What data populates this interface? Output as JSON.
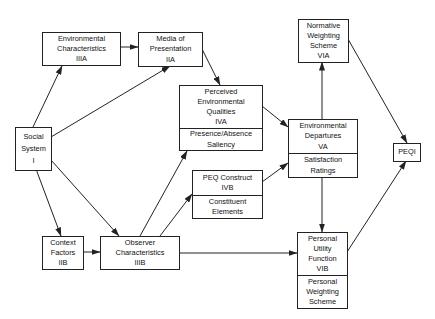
{
  "diagram": {
    "type": "flowchart",
    "line_color": "#222222",
    "nodes": {
      "env_char": {
        "lines": [
          "Environmental",
          "Characteristics",
          "IIIA"
        ]
      },
      "media": {
        "lines": [
          "Media of",
          "Presentation",
          "IIA"
        ]
      },
      "social": {
        "lines": [
          "Social",
          "System",
          "I"
        ]
      },
      "context": {
        "lines": [
          "Context",
          "Factors",
          "IIB"
        ]
      },
      "observer": {
        "lines": [
          "Observer",
          "Characteristics",
          "IIIB"
        ]
      },
      "peq_qual": {
        "lines": [
          "Perceived",
          "Environmental",
          "Qualities",
          "IVA"
        ],
        "sub_lines": [
          "Presence/Absence",
          "Saliency"
        ]
      },
      "peq_construct": {
        "lines": [
          "PEQ Construct",
          "IVB"
        ],
        "sub_lines": [
          "Constituent",
          "Elements"
        ]
      },
      "env_dep": {
        "lines": [
          "Environmental",
          "Departures",
          "VA"
        ],
        "sub_lines": [
          "Satisfaction",
          "Ratings"
        ]
      },
      "normative": {
        "lines": [
          "Normative",
          "Weighting",
          "Scheme",
          "VIA"
        ]
      },
      "peqi": {
        "lines": [
          "PEQI"
        ]
      },
      "utility": {
        "lines": [
          "Personal",
          "Utility",
          "Function",
          "VIB"
        ],
        "sub_lines": [
          "Personal",
          "Weighting",
          "Scheme"
        ]
      }
    },
    "edges": [
      [
        "social",
        "env_char"
      ],
      [
        "social",
        "media"
      ],
      [
        "social",
        "context"
      ],
      [
        "social",
        "observer"
      ],
      [
        "env_char",
        "media"
      ],
      [
        "media",
        "peq_qual"
      ],
      [
        "context",
        "observer"
      ],
      [
        "observer",
        "peq_qual"
      ],
      [
        "observer",
        "peq_construct"
      ],
      [
        "observer",
        "utility"
      ],
      [
        "peq_qual",
        "env_dep"
      ],
      [
        "peq_construct",
        "env_dep"
      ],
      [
        "env_dep",
        "normative"
      ],
      [
        "env_dep",
        "utility"
      ],
      [
        "normative",
        "peqi"
      ],
      [
        "utility",
        "peqi"
      ]
    ]
  }
}
